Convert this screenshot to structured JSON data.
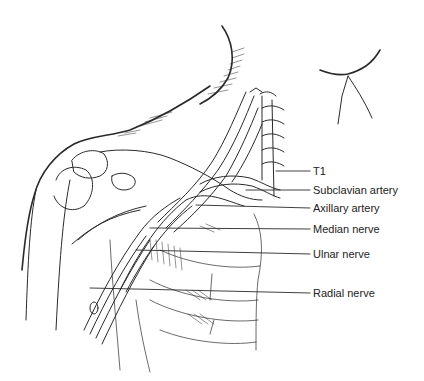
{
  "figure": {
    "type": "anatomical line drawing"
  },
  "labels": [
    {
      "text": "T1",
      "y": 171
    },
    {
      "text": "Subclavian artery",
      "y": 190
    },
    {
      "text": "Axillary artery",
      "y": 208
    },
    {
      "text": "Median nerve",
      "y": 229
    },
    {
      "text": "Ulnar nerve",
      "y": 254
    },
    {
      "text": "Radial nerve",
      "y": 293
    }
  ]
}
